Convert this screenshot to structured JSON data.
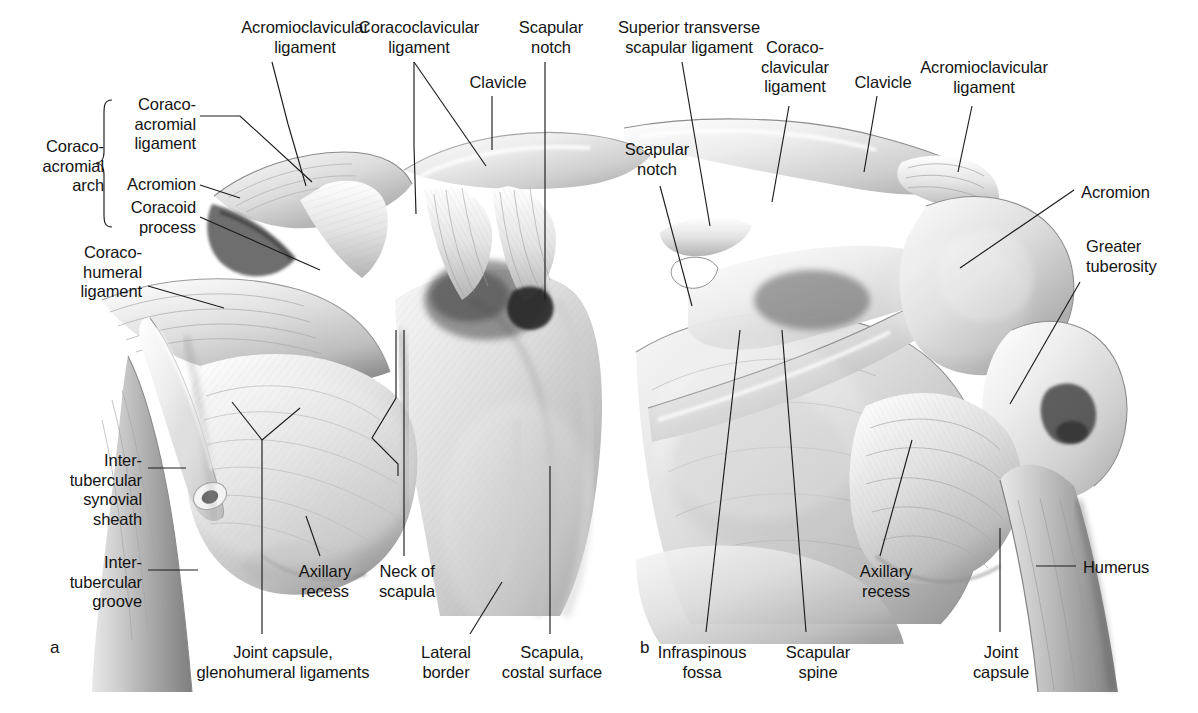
{
  "figure": {
    "type": "anatomical-illustration",
    "background_color": "#ffffff",
    "ink_color": "#141414",
    "rendering": "grayscale pencil / airbrush medical illustration",
    "panels": [
      {
        "id": "a",
        "letter": "a",
        "view": "anterior view",
        "letter_pos": {
          "x": 50,
          "y": 648
        }
      },
      {
        "id": "b",
        "letter": "b",
        "view": "posterior view",
        "letter_pos": {
          "x": 640,
          "y": 648
        }
      }
    ]
  },
  "panel_a": {
    "bracket": {
      "label": "Coraco-\nacromial\narch",
      "x": 72,
      "y": 137,
      "brace_x": 106,
      "brace_top": 100,
      "brace_bottom": 227
    },
    "labels": [
      {
        "name": "coracoacromial-ligament",
        "text": "Coraco-\nacromial\nligament",
        "x": 196,
        "y": 95,
        "align": "r",
        "leader": [
          [
            200,
            115
          ],
          [
            238,
            115
          ],
          [
            310,
            181
          ]
        ]
      },
      {
        "name": "acromion",
        "text": "Acromion",
        "x": 196,
        "y": 175,
        "align": "r",
        "leader": [
          [
            200,
            184
          ],
          [
            238,
            196
          ]
        ]
      },
      {
        "name": "coracoid-process",
        "text": "Coracoid\nprocess",
        "x": 196,
        "y": 198,
        "align": "r",
        "leader": [
          [
            200,
            216
          ],
          [
            318,
            268
          ]
        ]
      },
      {
        "name": "acromioclavicular-ligament",
        "text": "Acromioclavicular\nligament",
        "x": 305,
        "y": 18,
        "align": "c",
        "leader": [
          [
            288,
            62
          ],
          [
            288,
            62
          ],
          [
            288,
            62
          ]
        ],
        "leader_line": [
          [
            268,
            62
          ],
          [
            287,
            122
          ],
          [
            287,
            172
          ]
        ]
      },
      {
        "name": "coracoclavicular-ligament",
        "text": "Coracoclavicular\nligament",
        "x": 419,
        "y": 18,
        "align": "c",
        "leader": [
          [
            412,
            62
          ],
          [
            412,
            145
          ],
          [
            412,
            210
          ]
        ]
      },
      {
        "name": "coracoclavicular-ligament-second",
        "text": "",
        "leader": [
          [
            412,
            62
          ],
          [
            484,
            160
          ]
        ]
      },
      {
        "name": "clavicle",
        "text": "Clavicle",
        "x": 498,
        "y": 73,
        "align": "c",
        "leader": [
          [
            492,
            95
          ],
          [
            492,
            142
          ]
        ]
      },
      {
        "name": "scapular-notch",
        "text": "Scapular\nnotch",
        "x": 551,
        "y": 18,
        "align": "c",
        "leader": [
          [
            545,
            62
          ],
          [
            545,
            296
          ]
        ]
      },
      {
        "name": "coracohumeral-ligament",
        "text": "Coraco-\nhumeral\nligament",
        "x": 142,
        "y": 243,
        "align": "r",
        "leader": [
          [
            146,
            283
          ],
          [
            222,
            305
          ]
        ]
      },
      {
        "name": "intertubercular-synovial-sheath",
        "text": "Inter-\ntubercular\nsynovial\nsheath",
        "x": 142,
        "y": 451,
        "align": "r",
        "leader": [
          [
            146,
            468
          ],
          [
            180,
            468
          ]
        ]
      },
      {
        "name": "intertubercular-groove",
        "text": "Inter-\ntubercular\ngroove",
        "x": 142,
        "y": 553,
        "align": "r",
        "leader": [
          [
            146,
            570
          ],
          [
            194,
            570
          ]
        ]
      },
      {
        "name": "joint-capsule-glenohumeral-ligaments",
        "text": "Joint capsule,\nglenohumeral ligaments",
        "x": 283,
        "y": 643,
        "align": "c",
        "leader": [
          [
            262,
            430
          ],
          [
            262,
            460
          ],
          [
            228,
            500
          ],
          [
            262,
            430
          ],
          [
            262,
            637
          ]
        ],
        "leader_line": [
          [
            268,
            400
          ],
          [
            262,
            437
          ],
          [
            262,
            637
          ]
        ]
      },
      {
        "name": "axillary-recess",
        "text": "Axillary\nrecess",
        "x": 325,
        "y": 570,
        "align": "c",
        "leader": [
          [
            318,
            555
          ],
          [
            303,
            510
          ]
        ]
      },
      {
        "name": "neck-of-scapula",
        "text": "Neck of\nscapula",
        "x": 407,
        "y": 570,
        "align": "c",
        "leader": [
          [
            404,
            555
          ],
          [
            404,
            330
          ]
        ]
      },
      {
        "name": "lateral-border",
        "text": "Lateral\nborder",
        "x": 446,
        "y": 643,
        "align": "c",
        "leader": [
          [
            470,
            637
          ],
          [
            498,
            586
          ]
        ]
      },
      {
        "name": "scapula-costal-surface",
        "text": "Scapula,\ncostal surface",
        "x": 552,
        "y": 643,
        "align": "c",
        "leader": [
          [
            550,
            637
          ],
          [
            550,
            467
          ]
        ]
      }
    ]
  },
  "panel_b": {
    "labels": [
      {
        "name": "superior-transverse-scapular-ligament",
        "text": "Superior transverse\nscapular ligament",
        "x": 689,
        "y": 18,
        "align": "c",
        "leader": [
          [
            682,
            62
          ],
          [
            708,
            220
          ]
        ]
      },
      {
        "name": "coracoclavicular-ligament",
        "text": "Coraco-\nclavicular\nligament",
        "x": 795,
        "y": 38,
        "align": "c",
        "leader": [
          [
            789,
            103
          ],
          [
            776,
            198
          ]
        ]
      },
      {
        "name": "clavicle",
        "text": "Clavicle",
        "x": 883,
        "y": 73,
        "align": "c",
        "leader": [
          [
            877,
            95
          ],
          [
            866,
            168
          ]
        ]
      },
      {
        "name": "acromioclavicular-ligament",
        "text": "Acromioclavicular\nligament",
        "x": 984,
        "y": 58,
        "align": "c",
        "leader": [
          [
            972,
            103
          ],
          [
            963,
            165
          ]
        ]
      },
      {
        "name": "scapular-notch",
        "text": "Scapular\nnotch",
        "x": 657,
        "y": 140,
        "align": "c",
        "leader": [
          [
            659,
            183
          ],
          [
            690,
            305
          ]
        ]
      },
      {
        "name": "acromion",
        "text": "Acromion",
        "x": 1081,
        "y": 183,
        "align": "l",
        "leader": [
          [
            1077,
            193
          ],
          [
            962,
            264
          ]
        ]
      },
      {
        "name": "greater-tuberosity",
        "text": "Greater\ntuberosity",
        "x": 1086,
        "y": 237,
        "align": "l",
        "leader": [
          [
            1082,
            280
          ],
          [
            1012,
            400
          ]
        ]
      },
      {
        "name": "humerus",
        "text": "Humerus",
        "x": 1083,
        "y": 558,
        "align": "l",
        "leader": [
          [
            1079,
            566
          ],
          [
            1039,
            566
          ]
        ]
      },
      {
        "name": "infraspinous-fossa",
        "text": "Infraspinous\nfossa",
        "x": 702,
        "y": 643,
        "align": "c",
        "leader": [
          [
            708,
            637
          ],
          [
            738,
            330
          ]
        ]
      },
      {
        "name": "scapular-spine",
        "text": "Scapular\nspine",
        "x": 818,
        "y": 643,
        "align": "c",
        "leader": [
          [
            806,
            637
          ],
          [
            783,
            330
          ]
        ]
      },
      {
        "name": "axillary-recess",
        "text": "Axillary\nrecess",
        "x": 886,
        "y": 570,
        "align": "c",
        "leader": [
          [
            880,
            555
          ],
          [
            910,
            438
          ]
        ]
      },
      {
        "name": "joint-capsule",
        "text": "Joint\ncapsule",
        "x": 1001,
        "y": 643,
        "align": "c",
        "leader": [
          [
            1000,
            637
          ],
          [
            1000,
            530
          ]
        ]
      }
    ]
  }
}
